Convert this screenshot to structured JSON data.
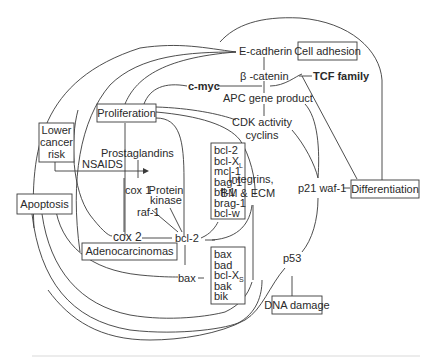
{
  "diagram": {
    "title": "",
    "boxed_nodes": {
      "cell_adhesion": "Cell adhesion",
      "proliferation": "Proliferation",
      "lower_cancer_risk": [
        "Lower",
        "cancer",
        "risk"
      ],
      "apoptosis": "Apoptosis",
      "adenocarcinomas": "Adenocarcinomas",
      "differentiation": "Differentiation",
      "dna_damage": "DNA damage"
    },
    "nodes": {
      "e_cadherin": "E-cadherin",
      "beta_catenin": "β -catenin",
      "tcf_family": "TCF family",
      "c_myc": "c-myc",
      "apc": "APC gene product",
      "cdk": [
        "CDK activity",
        "cyclins"
      ],
      "prostaglandins": "Prostaglandins",
      "nsaids": "NSAIDS",
      "cox1": "cox 1",
      "protein_kinase": [
        "Protein",
        "kinase"
      ],
      "raf1": "raf-1",
      "cox2": "cox 2",
      "bcl2": "bcl-2",
      "bax": "bax",
      "integrins": [
        "Integrins,",
        "BM & ECM"
      ],
      "p21": "p21 waf-1",
      "p53": "p53"
    },
    "anti_apoptotic_list": [
      {
        "text": "bcl-2",
        "sub": ""
      },
      {
        "text": "bcl-X",
        "sub": "L"
      },
      {
        "text": "mcl-1",
        "sub": ""
      },
      {
        "text": "bag-1",
        "sub": ""
      },
      {
        "text": "bfl-1",
        "sub": ""
      },
      {
        "text": "brag-1",
        "sub": ""
      },
      {
        "text": "bcl-w",
        "sub": ""
      }
    ],
    "pro_apoptotic_list": [
      {
        "text": "bax",
        "sub": ""
      },
      {
        "text": "bad",
        "sub": ""
      },
      {
        "text": "bcl-X",
        "sub": "S"
      },
      {
        "text": "bak",
        "sub": ""
      },
      {
        "text": "bik",
        "sub": ""
      }
    ],
    "edges": [
      {
        "from": "E-cadherin",
        "to": "Cell adhesion"
      },
      {
        "from": "E-cadherin",
        "to": "β -catenin"
      },
      {
        "from": "β -catenin",
        "to": "TCF family"
      },
      {
        "from": "β -catenin",
        "to": "APC gene product"
      },
      {
        "from": "APC gene product",
        "to": "CDK activity"
      },
      {
        "from": "c-myc",
        "to": "β -catenin"
      },
      {
        "from": "c-myc",
        "to": "Proliferation"
      },
      {
        "from": "Proliferation",
        "to": "E-cadherin"
      },
      {
        "from": "Proliferation",
        "to": "CDK activity"
      },
      {
        "from": "Lower cancer risk",
        "to": "Prostaglandins",
        "label": "NSAIDS",
        "arrow": true
      },
      {
        "from": "cox 2",
        "to": "bcl-2"
      },
      {
        "from": "raf-1",
        "to": "bcl-2"
      },
      {
        "from": "Protein kinase",
        "to": "bcl-2"
      },
      {
        "from": "bcl-2",
        "to": "bax"
      },
      {
        "from": "p21 waf-1",
        "to": "Differentiation"
      },
      {
        "from": "p53",
        "to": "DNA damage"
      },
      {
        "from": "TCF family",
        "to": "Differentiation"
      },
      {
        "from": "Apoptosis",
        "to": "E-cadherin"
      },
      {
        "from": "Differentiation",
        "to": "E-cadherin"
      },
      {
        "from": "Apoptosis",
        "to": "p53"
      },
      {
        "from": "Apoptosis",
        "to": "Integrins"
      }
    ]
  }
}
